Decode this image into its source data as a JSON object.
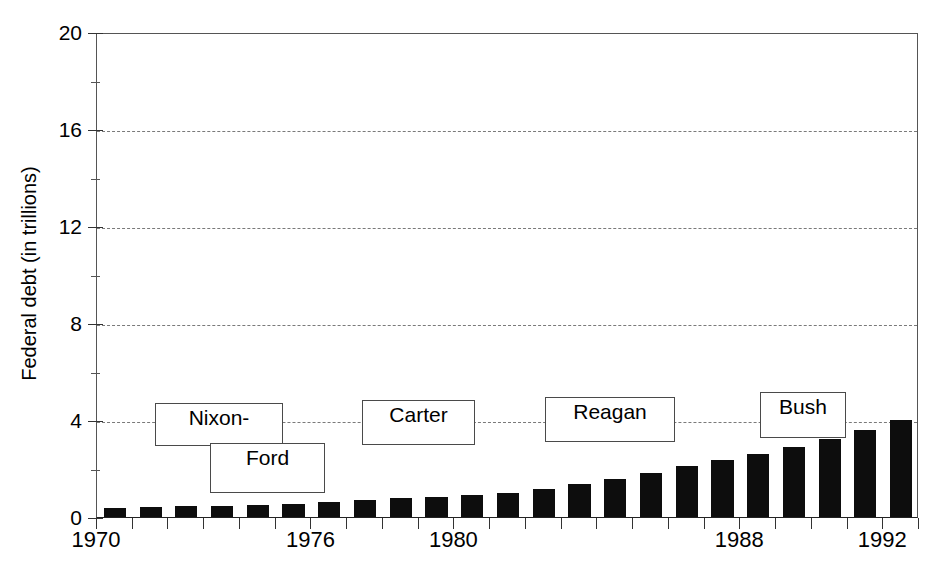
{
  "chart_data": {
    "type": "bar",
    "title": "",
    "xlabel": "",
    "ylabel": "Federal debt (in trillions)",
    "ylim": [
      0,
      20
    ],
    "yticks": [
      0,
      4,
      8,
      12,
      16,
      20
    ],
    "ytick_labels": [
      "0",
      "4",
      "8",
      "12",
      "16",
      "20"
    ],
    "minor_yticks": [
      2,
      6,
      10,
      14,
      18
    ],
    "grid": true,
    "grid_axis": "y",
    "grid_style": "dashed",
    "legend": "none",
    "bar_color": "#0d0d0d",
    "categories": [
      "1970",
      "1971",
      "1972",
      "1973",
      "1974",
      "1975",
      "1976",
      "1977",
      "1978",
      "1979",
      "1980",
      "1981",
      "1982",
      "1983",
      "1984",
      "1985",
      "1986",
      "1987",
      "1988",
      "1989",
      "1990",
      "1991",
      "1992"
    ],
    "xtick_labels": [
      "1970",
      "1976",
      "1980",
      "1988",
      "1992"
    ],
    "xtick_categories": [
      "1970",
      "1976",
      "1980",
      "1988",
      "1992"
    ],
    "values": [
      0.38,
      0.41,
      0.44,
      0.47,
      0.49,
      0.54,
      0.63,
      0.71,
      0.78,
      0.83,
      0.91,
      1.0,
      1.14,
      1.37,
      1.56,
      1.82,
      2.12,
      2.35,
      2.6,
      2.87,
      3.21,
      3.6,
      4.0
    ],
    "annotations": [
      {
        "label": "Nixon-",
        "name": "nixon"
      },
      {
        "label": "Ford",
        "name": "ford"
      },
      {
        "label": "Carter",
        "name": "carter"
      },
      {
        "label": "Reagan",
        "name": "reagan"
      },
      {
        "label": "Bush",
        "name": "bush"
      }
    ]
  }
}
